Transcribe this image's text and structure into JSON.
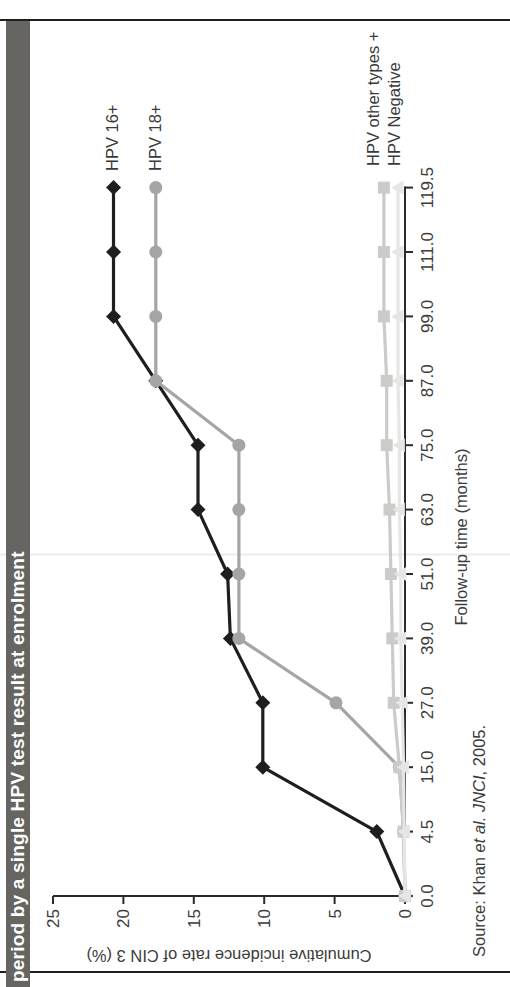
{
  "title": {
    "text": "period by a single HPV test result at enrolment"
  },
  "chart_data": {
    "type": "line",
    "title": "period by a single HPV test result at enrolment",
    "xlabel": "Follow-up time (months)",
    "ylabel": "Cumulative incidence rate of CIN 3 (%)",
    "x_values": [
      0.0,
      4.5,
      15.0,
      27.0,
      39.0,
      51.0,
      63.0,
      75.0,
      87.0,
      99.0,
      111.0,
      119.5
    ],
    "x_tick_labels": [
      "0.0",
      "4.5",
      "15.0",
      "27.0",
      "39.0",
      "51.0",
      "63.0",
      "75.0",
      "87.0",
      "99.0",
      "111.0",
      "119.5"
    ],
    "y_ticks": [
      0,
      5,
      10,
      15,
      20,
      25
    ],
    "y_tick_labels": [
      "0",
      "5",
      "10",
      "15",
      "20",
      "25"
    ],
    "ylim": [
      0,
      25
    ],
    "grid": false,
    "legend_position": "end-of-line",
    "series": [
      {
        "name": "HPV 16+",
        "marker": "diamond",
        "color": "#1e1e1e",
        "values": [
          0,
          2.0,
          10.1,
          10.1,
          12.4,
          12.6,
          14.7,
          14.7,
          17.7,
          20.7,
          20.7,
          20.7
        ]
      },
      {
        "name": "HPV 18+",
        "marker": "circle",
        "color": "#a5a5a3",
        "values": [
          0,
          0.1,
          0.4,
          4.9,
          11.8,
          11.8,
          11.8,
          11.8,
          17.7,
          17.7,
          17.7,
          17.7
        ]
      },
      {
        "name": "HPV other types +",
        "marker": "square",
        "color": "#cbcbc9",
        "values": [
          0,
          0.1,
          0.4,
          0.8,
          0.9,
          1.0,
          1.1,
          1.3,
          1.3,
          1.5,
          1.5,
          1.5
        ]
      },
      {
        "name": "HPV Negative",
        "marker": "triangle",
        "color": "#e6e6e4",
        "values": [
          0,
          0.05,
          0.1,
          0.2,
          0.3,
          0.3,
          0.4,
          0.4,
          0.5,
          0.5,
          0.5,
          0.5
        ]
      }
    ]
  },
  "source": {
    "prefix": "Source: Khan ",
    "italic": "et al. JNCI",
    "suffix": ", 2005."
  },
  "colors": {
    "title_bar_bg": "#666562",
    "title_text": "#ffffff",
    "slide_border": "#1f1f1f",
    "axis_text": "#3c3c3c"
  }
}
